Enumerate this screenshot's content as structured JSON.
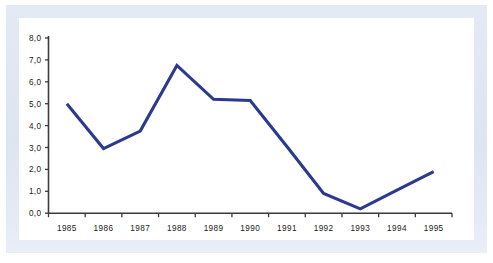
{
  "chart_data": {
    "type": "line",
    "title": "",
    "subtitle": "",
    "xlabel": "",
    "ylabel": "",
    "categories": [
      "1985",
      "1986",
      "1987",
      "1988",
      "1989",
      "1990",
      "1991",
      "1992",
      "1993",
      "1994",
      "1995"
    ],
    "series": [
      {
        "name": "",
        "values": [
          5.0,
          2.95,
          3.75,
          6.75,
          5.2,
          5.15,
          3.05,
          0.9,
          0.2,
          1.05,
          1.9
        ],
        "color": "#2b3a8c"
      }
    ],
    "ylim": [
      0.0,
      8.0
    ],
    "ytick_step": 1.0,
    "ytick_labels": [
      "0,0",
      "1,0",
      "2,0",
      "3,0",
      "4,0",
      "5,0",
      "6,0",
      "7,0",
      "8,0"
    ],
    "xtick_labels": [
      "1985",
      "1986",
      "1987",
      "1988",
      "1989",
      "1990",
      "1991",
      "1992",
      "1993",
      "1994",
      "1995"
    ],
    "grid": false,
    "legend": false,
    "legend_position": "none",
    "decimal_separator": ",",
    "markers": false,
    "annotations": []
  },
  "style": {
    "line_color": "#2b3a8c",
    "axis_color": "#3a3a3a",
    "plot_background": "#ffffff",
    "frame_color": "#dfe6f2",
    "tick_label_color": "#1a1a1a"
  }
}
